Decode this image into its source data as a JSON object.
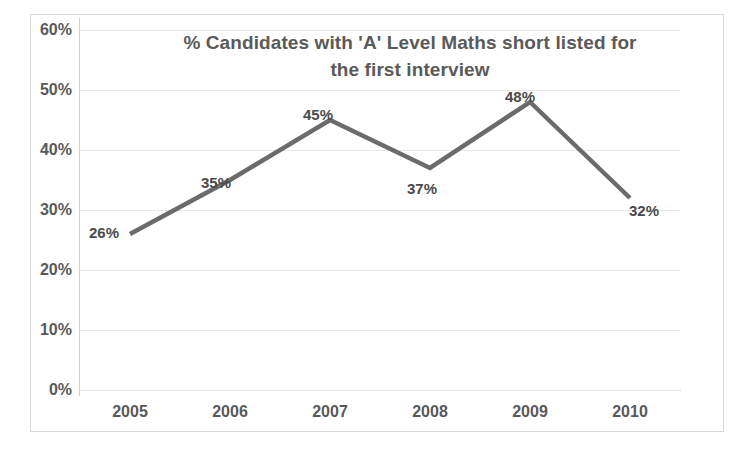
{
  "chart_data": {
    "type": "line",
    "title": "% Candidates with 'A' Level Maths short listed for the first interview",
    "title_line1": "% Candidates with 'A' Level Maths short listed for",
    "title_line2": "the first interview",
    "xlabel": "",
    "ylabel": "",
    "categories": [
      "2005",
      "2006",
      "2007",
      "2008",
      "2009",
      "2010"
    ],
    "values": [
      26,
      35,
      45,
      37,
      48,
      32
    ],
    "point_labels": [
      "26%",
      "35%",
      "45%",
      "37%",
      "48%",
      "32%"
    ],
    "ylim": [
      0,
      60
    ],
    "y_ticks": [
      0,
      10,
      20,
      30,
      40,
      50,
      60
    ],
    "y_tick_labels": [
      "0%",
      "10%",
      "20%",
      "30%",
      "40%",
      "50%",
      "60%"
    ],
    "grid": true,
    "legend": false,
    "legend_position": "none",
    "series_color": "#6b6b6b",
    "grid_color": "#e8e8e8",
    "axis_text_color": "#595959",
    "title_color": "#5a5a5a",
    "label_color": "#4a4a4a",
    "frame_color": "#d9d9d9",
    "background": "#ffffff"
  }
}
